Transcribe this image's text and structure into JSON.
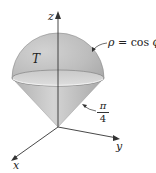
{
  "figure": {
    "type": "3d-solid-diagram",
    "axes": {
      "z": {
        "label": "z"
      },
      "y": {
        "label": "y"
      },
      "x": {
        "label": "x"
      }
    },
    "region": {
      "label": "T"
    },
    "annotations": {
      "sphere": {
        "rho": "ρ",
        "equals": " = ",
        "rhs": "cos ",
        "phi": "ϕ"
      },
      "cone_angle": {
        "numerator": "π",
        "denominator": "4"
      }
    },
    "colors": {
      "hemisphere_fill": "#b8b8b8",
      "cone_fill": "#c4c4c4",
      "equator_disk": "#d6d6d6",
      "axis": "#333333",
      "outline": "#8a8a8a"
    }
  }
}
